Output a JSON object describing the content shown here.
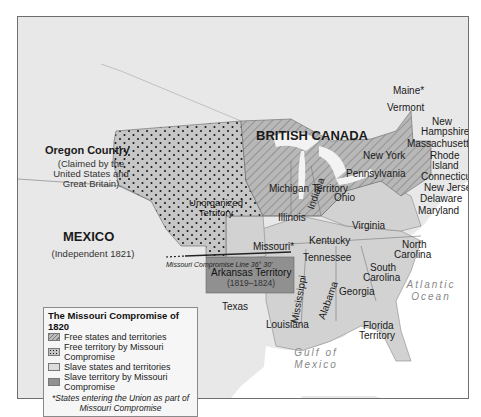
{
  "map": {
    "title": "The Missouri Compromise of 1820",
    "colors": {
      "ocean": "#ffffff",
      "land_foreign": "#e6e6e6",
      "slave": "#d0d0d0",
      "slave_compromise": "#8f8f8f",
      "free": "#b5b5b5",
      "free_compromise": "#c4c4c4",
      "border": "#6e6e6e"
    },
    "regions": {
      "british_canada": "BRITISH CANADA",
      "oregon_country": "Oregon Country",
      "oregon_note_1": "(Claimed by the",
      "oregon_note_2": "United States and",
      "oregon_note_3": "Great Britain)",
      "mexico": "MEXICO",
      "mexico_note": "(Independent 1821)",
      "unorganized_1": "Unorganized",
      "unorganized_2": "Territory",
      "michigan": "Michigan",
      "michigan_territory": "Territory",
      "arkansas": "Arkansas Territory",
      "arkansas_years": "(1819–1824)",
      "compromise_line": "Missouri Compromise Line 36° 30'",
      "atlantic_1": "Atlantic",
      "atlantic_2": "Ocean",
      "gulf_1": "Gulf of",
      "gulf_2": "Mexico"
    },
    "states": {
      "maine": "Maine*",
      "vermont": "Vermont",
      "new_hampshire_1": "New",
      "new_hampshire_2": "Hampshire",
      "massachusetts": "Massachusetts",
      "rhode_island_1": "Rhode",
      "rhode_island_2": "Island",
      "connecticut": "Connecticut",
      "new_york": "New York",
      "new_jersey": "New Jersey",
      "pennsylvania": "Pennsylvania",
      "delaware": "Delaware",
      "maryland": "Maryland",
      "ohio": "Ohio",
      "indiana": "Indiana",
      "illinois": "Illinois",
      "missouri": "Missouri*",
      "kentucky": "Kentucky",
      "virginia": "Virginia",
      "tennessee": "Tennessee",
      "north_carolina_1": "North",
      "north_carolina_2": "Carolina",
      "south_carolina_1": "South",
      "south_carolina_2": "Carolina",
      "georgia": "Georgia",
      "alabama": "Alabama",
      "mississippi": "Mississippi",
      "louisiana": "Louisiana",
      "texas": "Texas",
      "florida_1": "Florida",
      "florida_2": "Territory"
    }
  },
  "legend": {
    "title": "The Missouri Compromise of 1820",
    "items": [
      {
        "label": "Free states and territories",
        "swatch": "hatched"
      },
      {
        "label": "Free territory by Missouri Compromise",
        "swatch": "dotted"
      },
      {
        "label": "Slave states and territories",
        "swatch": "light"
      },
      {
        "label": "Slave territory by Missouri Compromise",
        "swatch": "dark"
      }
    ],
    "note_1": "*States entering the Union as part of",
    "note_2": "Missouri Compromise"
  }
}
